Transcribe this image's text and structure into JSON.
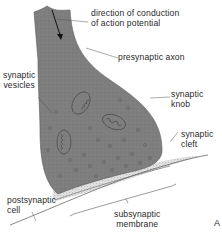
{
  "figure": {
    "type": "synapse-diagram",
    "panel_letter": "A",
    "colors": {
      "terminal_fill": "#7d7d7d",
      "terminal_edge": "#5a5a5a",
      "cleft_stipple": "#b8b8b8",
      "line": "#555555",
      "text": "#2a2a2a",
      "background": "#ffffff"
    }
  },
  "labels": {
    "direction": "direction of conduction\nof action potential",
    "presynaptic_axon": "presynaptic axon",
    "synaptic_vesicles": "synaptic\nvesicles",
    "synaptic_knob": "synaptic\nknob",
    "synaptic_cleft": "synaptic\ncleft",
    "postsynaptic_cell": "postsynaptic\ncell",
    "subsynaptic_membrane": "subsynaptic\nmembrane"
  }
}
